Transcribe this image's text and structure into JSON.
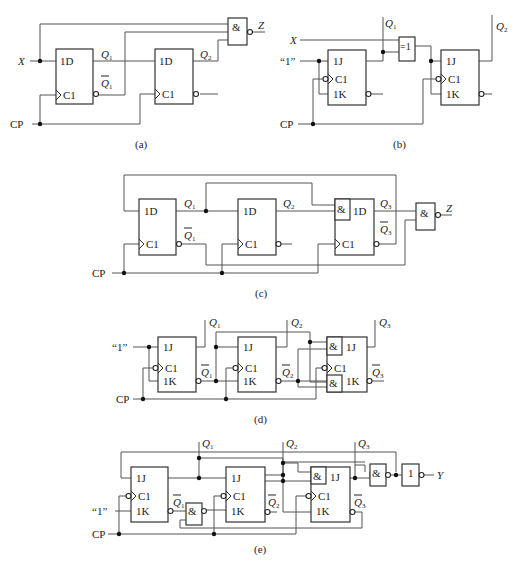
{
  "figure": {
    "captions": [
      "(a)",
      "(b)",
      "(c)",
      "(d)",
      "(e)"
    ]
  },
  "circuit_a": {
    "inputs": {
      "x": "X",
      "cp": "CP"
    },
    "ff1": {
      "d": "1D",
      "clk": "C1",
      "q": "Q",
      "q_sub": "1",
      "qn": "Q",
      "qn_sub": "1"
    },
    "ff2": {
      "d": "1D",
      "clk": "C1",
      "q": "Q",
      "q_sub": "2"
    },
    "gate": {
      "symbol": "&",
      "type": "NAND"
    },
    "output": "Z"
  },
  "circuit_b": {
    "inputs": {
      "x": "X",
      "one": "“1”",
      "cp": "CP"
    },
    "ff1": {
      "j": "1J",
      "clk": "C1",
      "k": "1K",
      "q": "Q",
      "q_sub": "1"
    },
    "xor": {
      "symbol": "=1"
    },
    "ff2": {
      "j": "1J",
      "clk": "C1",
      "k": "1K",
      "q": "Q",
      "q_sub": "2"
    }
  },
  "circuit_c": {
    "inputs": {
      "cp": "CP"
    },
    "ff1": {
      "d": "1D",
      "clk": "C1",
      "q": "Q",
      "q_sub": "1",
      "qn": "Q",
      "qn_sub": "1"
    },
    "ff2": {
      "d": "1D",
      "clk": "C1",
      "q": "Q",
      "q_sub": "2"
    },
    "ff3": {
      "and": "&",
      "d": "1D",
      "clk": "C1",
      "q": "Q",
      "q_sub": "3",
      "qn": "Q",
      "qn_sub": "3"
    },
    "gate": {
      "symbol": "&",
      "type": "NAND"
    },
    "output": "Z"
  },
  "circuit_d": {
    "inputs": {
      "one": "“1”",
      "cp": "CP"
    },
    "ff1": {
      "j": "1J",
      "clk": "C1",
      "k": "1K",
      "q": "Q",
      "q_sub": "1",
      "qn": "Q",
      "qn_sub": "1"
    },
    "ff2": {
      "j": "1J",
      "clk": "C1",
      "k": "1K",
      "q": "Q",
      "q_sub": "2",
      "qn": "Q",
      "qn_sub": "2"
    },
    "ff3": {
      "and_j": "&",
      "j": "1J",
      "clk": "C1",
      "and_k": "&",
      "k": "1K",
      "q": "Q",
      "q_sub": "3",
      "qn": "Q",
      "qn_sub": "3"
    }
  },
  "circuit_e": {
    "inputs": {
      "one": "“1”",
      "cp": "CP"
    },
    "ff1": {
      "j": "1J",
      "clk": "C1",
      "k": "1K",
      "q": "Q",
      "q_sub": "1",
      "qn": "Q",
      "qn_sub": "1"
    },
    "nand_mid": {
      "symbol": "&"
    },
    "ff2": {
      "j": "1J",
      "clk": "C1",
      "k": "1K",
      "q": "Q",
      "q_sub": "2",
      "qn": "Q",
      "qn_sub": "2"
    },
    "ff3": {
      "and_j": "&",
      "j": "1J",
      "clk": "C1",
      "k": "1K",
      "q": "Q",
      "q_sub": "3",
      "qn": "Q",
      "qn_sub": "3"
    },
    "nand_out": {
      "symbol": "&"
    },
    "inverter": {
      "symbol": "1"
    },
    "output": "Y"
  }
}
